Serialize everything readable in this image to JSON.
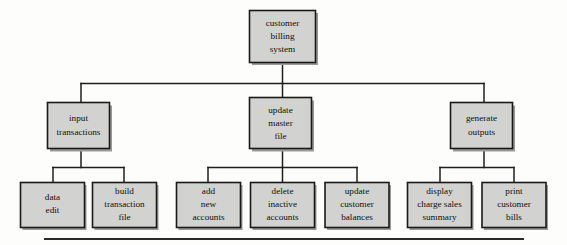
{
  "diagram": {
    "type": "structure-chart",
    "title": "customer billing system",
    "colors": {
      "box_fill": "#d2d2d0",
      "box_border": "#1a1a1a",
      "connector": "#1f1f1f",
      "shadow": "#9a9a98",
      "background": "#fdfdfc",
      "text": "#100f0d",
      "rule": "#2b2b2b"
    },
    "levels": {
      "level1_label": "root",
      "level2_label": "modules",
      "level3_label": "submodules"
    },
    "nodes": {
      "root": {
        "id": "customer-billing-system",
        "lines": [
          "customer",
          "billing",
          "system"
        ],
        "level": 1
      },
      "level2": [
        {
          "id": "input-transactions",
          "lines": [
            "input",
            "transactions"
          ],
          "level": 2
        },
        {
          "id": "update-master-file",
          "lines": [
            "update",
            "master",
            "file"
          ],
          "level": 2
        },
        {
          "id": "generate-outputs",
          "lines": [
            "generate",
            "outputs"
          ],
          "level": 2
        }
      ],
      "level3": [
        {
          "id": "data-edit",
          "parent": "input-transactions",
          "lines": [
            "data",
            "edit"
          ],
          "level": 3
        },
        {
          "id": "build-transaction-file",
          "parent": "input-transactions",
          "lines": [
            "build",
            "transaction",
            "file"
          ],
          "level": 3
        },
        {
          "id": "add-new-accounts",
          "parent": "update-master-file",
          "lines": [
            "add",
            "new",
            "accounts"
          ],
          "level": 3
        },
        {
          "id": "delete-inactive-accounts",
          "parent": "update-master-file",
          "lines": [
            "delete",
            "inactive",
            "accounts"
          ],
          "level": 3
        },
        {
          "id": "update-customer-balances",
          "parent": "update-master-file",
          "lines": [
            "update",
            "customer",
            "balances"
          ],
          "level": 3
        },
        {
          "id": "display-charge-sales-summary",
          "parent": "generate-outputs",
          "lines": [
            "display",
            "charge sales",
            "summary"
          ],
          "level": 3
        },
        {
          "id": "print-customer-bills",
          "parent": "generate-outputs",
          "lines": [
            "print",
            "customer",
            "bills"
          ],
          "level": 3
        }
      ]
    }
  }
}
